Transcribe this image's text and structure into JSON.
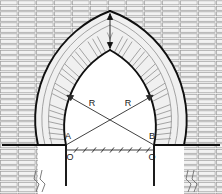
{
  "diagram": {
    "type": "architectural-line-drawing",
    "canvas": {
      "width": 222,
      "height": 194
    },
    "colors": {
      "background": "#ffffff",
      "heavy_line": "#101010",
      "brick_line": "#9a9a9a",
      "brick_fill": "#f2f2f2",
      "voussoir_fill": "#ededed",
      "thin_line": "#3a3a3a",
      "label_text": "#1a1a1a"
    },
    "labels": {
      "radius_left": "R",
      "radius_right": "R",
      "springing_left": "A",
      "springing_right": "B",
      "center_left": "O",
      "center_right": "O"
    },
    "label_positions": {
      "radius_left": {
        "x": 92,
        "y": 106
      },
      "radius_right": {
        "x": 128,
        "y": 106
      },
      "springing_left": {
        "x": 68,
        "y": 139
      },
      "springing_right": {
        "x": 152,
        "y": 139
      },
      "center_left": {
        "x": 70,
        "y": 156
      },
      "center_right": {
        "x": 152,
        "y": 156
      }
    },
    "geometry": {
      "springing_line_y": 145,
      "baseline_y": 150,
      "center_left_x": 66,
      "center_right_x": 154,
      "intrados_left_x": 66,
      "intrados_right_x": 154,
      "extrados_left_x": 38,
      "extrados_right_x": 184,
      "apex_x": 110,
      "intrados_apex_y": 50,
      "extrados_apex_y": 11,
      "ring_thickness": 28,
      "radius": 88
    },
    "annotations": {
      "dimension_line": "hatched-baseline-between-centers",
      "dimension_ticks": 9,
      "crown_marker": "vertical-double-arrow-at-crown",
      "break_symbol_left": "zigzag-break",
      "break_symbol_right": "zigzag-break",
      "radius_arrows": 2,
      "wall_bond": "running-bond-horizontal-brick",
      "arch_bond": "radial-voussoir-brick"
    }
  }
}
